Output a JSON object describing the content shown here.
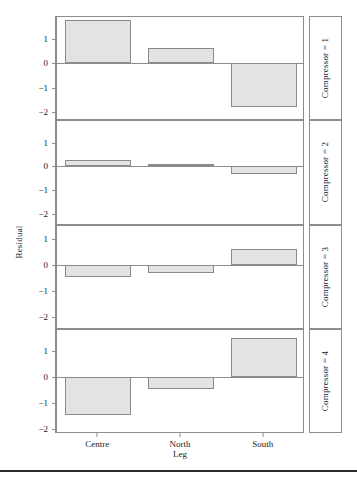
{
  "chart_data": {
    "type": "bar",
    "title": "",
    "subtitle": "",
    "xlabel": "Leg",
    "ylabel": "Residual",
    "categories": [
      "Centre",
      "North",
      "South"
    ],
    "grid": false,
    "legend": null,
    "facet_variable": "Compressor",
    "facet_layout": "vertical-stacked-4-rows",
    "panels": [
      {
        "strip_label": "Compressor = 1",
        "ylim": [
          -2.3,
          1.9
        ],
        "yticks": [
          1,
          0,
          -1,
          -2
        ],
        "ytick_labels": [
          "1",
          "0",
          "−1",
          "−2"
        ],
        "values": [
          1.76,
          0.62,
          -1.78
        ]
      },
      {
        "strip_label": "Compressor = 2",
        "ylim": [
          -2.4,
          1.9
        ],
        "yticks": [
          1,
          0,
          -1,
          -2
        ],
        "ytick_labels": [
          "1",
          "0",
          "−1",
          "−2"
        ],
        "values": [
          0.28,
          0.12,
          -0.32
        ]
      },
      {
        "strip_label": "Compressor = 3",
        "ylim": [
          -2.4,
          1.5
        ],
        "yticks": [
          1,
          0,
          -1,
          -2
        ],
        "ytick_labels": [
          "1",
          "0",
          "−1",
          "−2"
        ],
        "values": [
          -0.45,
          -0.32,
          0.62
        ]
      },
      {
        "strip_label": "Compressor = 4",
        "ylim": [
          -2.1,
          1.8
        ],
        "yticks": [
          1,
          0,
          -1,
          -2
        ],
        "ytick_labels": [
          "1",
          "0",
          "−1",
          "−2"
        ],
        "values": [
          -1.47,
          -0.45,
          1.47
        ]
      }
    ],
    "bar_fill_color": "#e3e3e3",
    "bar_border_color": "#8a8a8a",
    "axis_color": "#8d8d8d"
  }
}
